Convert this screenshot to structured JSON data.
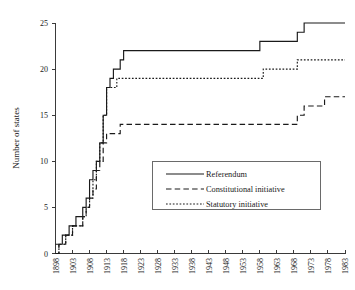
{
  "chart_data": {
    "type": "line",
    "title": "",
    "subtitle": "",
    "xlabel": "",
    "ylabel": "Number of states",
    "xlim": [
      1898,
      1983
    ],
    "ylim": [
      0,
      25
    ],
    "grid": false,
    "legend_position": "center-right-inside",
    "x_tick_labels": [
      "1898",
      "1903",
      "1908",
      "1913",
      "1918",
      "1923",
      "1928",
      "1933",
      "1938",
      "1943",
      "1948",
      "1953",
      "1958",
      "1963",
      "1968",
      "1973",
      "1978",
      "1983"
    ],
    "y_tick_labels": [
      "0",
      "5",
      "10",
      "15",
      "20",
      "25"
    ],
    "y_ticks": [
      0,
      5,
      10,
      15,
      20,
      25
    ],
    "x": [
      1898,
      1899,
      1900,
      1901,
      1902,
      1903,
      1904,
      1905,
      1906,
      1907,
      1908,
      1909,
      1910,
      1911,
      1912,
      1913,
      1914,
      1915,
      1916,
      1917,
      1918,
      1919,
      1920,
      1930,
      1940,
      1950,
      1956,
      1957,
      1958,
      1959,
      1960,
      1966,
      1967,
      1968,
      1969,
      1970,
      1971,
      1972,
      1973,
      1974,
      1975,
      1976,
      1977,
      1978,
      1979,
      1983
    ],
    "series": [
      {
        "name": "Referendum",
        "style": "solid",
        "values": [
          1,
          1,
          2,
          2,
          3,
          3,
          4,
          4,
          5,
          6,
          8,
          9,
          10,
          12,
          15,
          18,
          19,
          20,
          20,
          21,
          22,
          22,
          22,
          22,
          22,
          22,
          22,
          22,
          23,
          23,
          23,
          23,
          23,
          23,
          24,
          24,
          25,
          25,
          25,
          25,
          25,
          25,
          25,
          25,
          25,
          25
        ]
      },
      {
        "name": "Constitutional initiative",
        "style": "dashed",
        "values": [
          0,
          1,
          1,
          2,
          2,
          3,
          3,
          3,
          4,
          5,
          6,
          7,
          9,
          10,
          12,
          13,
          13,
          13,
          13,
          14,
          14,
          14,
          14,
          14,
          14,
          14,
          14,
          14,
          14,
          14,
          14,
          14,
          14,
          14,
          15,
          15,
          16,
          16,
          16,
          16,
          16,
          16,
          17,
          17,
          17,
          17
        ]
      },
      {
        "name": "Statutory initiative",
        "style": "dotted",
        "values": [
          0,
          1,
          1,
          2,
          2,
          3,
          3,
          3,
          4,
          5,
          6,
          8,
          10,
          12,
          15,
          18,
          18,
          18,
          19,
          19,
          19,
          19,
          19,
          19,
          19,
          19,
          19,
          19,
          19,
          20,
          20,
          20,
          20,
          20,
          21,
          21,
          21,
          21,
          21,
          21,
          21,
          21,
          21,
          21,
          21,
          21
        ]
      }
    ],
    "legend_entries": [
      {
        "label": "Referendum",
        "style": "solid"
      },
      {
        "label": "Constitutional initiative",
        "style": "dashed"
      },
      {
        "label": "Statutory initiative",
        "style": "dotted"
      }
    ]
  }
}
